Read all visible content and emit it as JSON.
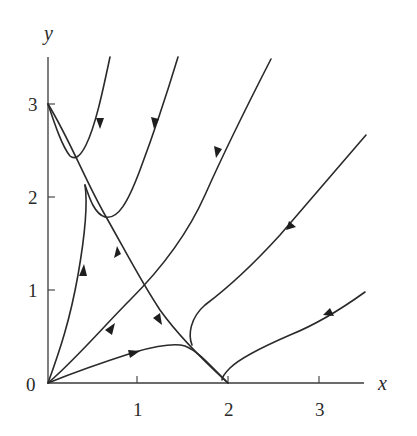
{
  "figure": {
    "type": "phase-portrait",
    "axes": {
      "x_label": "x",
      "y_label": "y",
      "origin_label": "0",
      "x_ticks": [
        "1",
        "2",
        "3"
      ],
      "y_ticks": [
        "1",
        "2",
        "3"
      ]
    },
    "equilibria": [
      {
        "name": "origin",
        "x": 0,
        "y": 0,
        "type": "unstable-node"
      },
      {
        "name": "y-axis-point",
        "x": 0,
        "y": 3,
        "type": "saddle"
      },
      {
        "name": "x-axis-point",
        "x": 2,
        "y": 0,
        "type": "stable-node"
      }
    ],
    "trajectories": [
      {
        "id": "t1",
        "description": "from top, dips near (0.3,2.4), joins separatrix toward (2,0)",
        "direction": "down"
      },
      {
        "id": "t2",
        "description": "from top, dips near (0.6,1.8), joins separatrix toward (2,0)",
        "direction": "down"
      },
      {
        "id": "t3",
        "description": "from upper right through (1.8,2.0) toward (1.6,0.35) then to (2,0)",
        "direction": "down-left"
      },
      {
        "id": "t4",
        "description": "from right (3.5,2.7) bends down to (2,0)",
        "direction": "down-left"
      },
      {
        "id": "t5",
        "description": "from right (3.5,1.0) curves into (2,0)",
        "direction": "left"
      },
      {
        "id": "t6",
        "description": "from origin up near y-axis to (0,3) region",
        "direction": "up"
      },
      {
        "id": "t7",
        "description": "from origin diagonally to upper right",
        "direction": "up-right"
      },
      {
        "id": "t8",
        "description": "from origin, humps near (1.3,0.4), into (2,0)",
        "direction": "right"
      },
      {
        "id": "t9",
        "description": "separatrix from (0,3) to (2,0)",
        "direction": "both-away-from-middle"
      }
    ]
  }
}
